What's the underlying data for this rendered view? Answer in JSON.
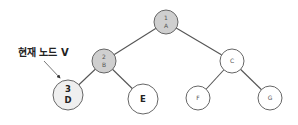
{
  "diagram": {
    "type": "binary-tree",
    "annotation": {
      "text": "현재 노드 V",
      "points_to": "D"
    },
    "nodes": [
      {
        "id": "A",
        "order": "1",
        "label": "A",
        "visited": true,
        "current": false
      },
      {
        "id": "B",
        "order": "2",
        "label": "B",
        "visited": true,
        "current": false
      },
      {
        "id": "C",
        "order": "",
        "label": "C",
        "visited": false,
        "current": false
      },
      {
        "id": "D",
        "order": "3",
        "label": "D",
        "visited": true,
        "current": true
      },
      {
        "id": "E",
        "order": "",
        "label": "E",
        "visited": false,
        "current": false
      },
      {
        "id": "F",
        "order": "",
        "label": "F",
        "visited": false,
        "current": false
      },
      {
        "id": "G",
        "order": "",
        "label": "G",
        "visited": false,
        "current": false
      }
    ],
    "edges": [
      [
        "A",
        "B"
      ],
      [
        "A",
        "C"
      ],
      [
        "B",
        "D"
      ],
      [
        "B",
        "E"
      ],
      [
        "C",
        "F"
      ],
      [
        "C",
        "G"
      ]
    ],
    "colors": {
      "visited": "#cfcfcf",
      "current": "#efefef",
      "unvisited": "#ffffff"
    }
  }
}
